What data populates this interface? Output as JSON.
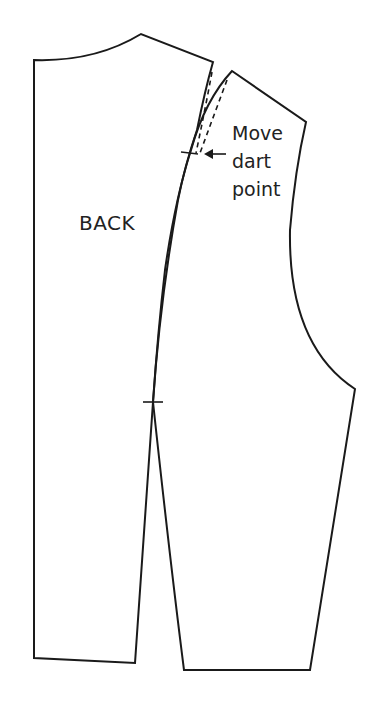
{
  "diagram": {
    "type": "sewing-pattern",
    "pieces": [
      {
        "id": "back",
        "label": "BACK"
      },
      {
        "id": "side-panel",
        "label": ""
      }
    ],
    "annotation": {
      "lines": [
        "Move",
        "dart",
        "point"
      ]
    },
    "markers": [
      "dart-point-notch",
      "waist-notch"
    ],
    "colors": {
      "stroke": "#1a1a1a",
      "background": "#ffffff"
    }
  }
}
